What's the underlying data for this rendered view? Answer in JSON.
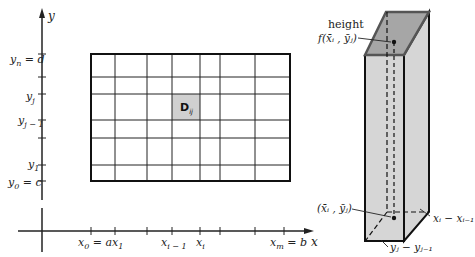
{
  "figure": {
    "axes": {
      "x_axis_label": "x",
      "y_axis_label": "y"
    },
    "x_ticks": [
      {
        "label": "x",
        "sub": "0",
        "suffix": " = a",
        "x": 91
      },
      {
        "label": "x",
        "sub": "1",
        "suffix": "",
        "x": 115
      },
      {
        "label": "x",
        "sub": "i − 1",
        "suffix": "",
        "x": 172
      },
      {
        "label": "x",
        "sub": "i",
        "suffix": "",
        "x": 200
      },
      {
        "label": "x",
        "sub": "m",
        "suffix": " = b",
        "x": 290
      }
    ],
    "y_ticks": [
      {
        "label": "y",
        "sub": "n",
        "suffix": " = d",
        "y": 54
      },
      {
        "label": "y",
        "sub": "j",
        "suffix": "",
        "y": 94
      },
      {
        "label": "y",
        "sub": "j − 1",
        "suffix": "",
        "y": 120
      },
      {
        "label": "y",
        "sub": "1",
        "suffix": "",
        "y": 165
      },
      {
        "label": "y",
        "sub": "0",
        "suffix": " = c",
        "y": 181
      }
    ],
    "grid": {
      "vertical_lines": [
        91,
        115,
        147,
        172,
        200,
        220,
        255,
        290
      ],
      "horizontal_lines": [
        54,
        77,
        94,
        120,
        138,
        165,
        181
      ]
    },
    "highlighted_cell": {
      "label": "D",
      "sub": "ij",
      "fill": "#d0d0d0"
    },
    "prism": {
      "height_label_line1": "height",
      "height_label_line2": "f(x̄ᵢ , ȳⱼ)",
      "point_label": "(x̄ᵢ , ȳⱼ)",
      "width_label": "xᵢ − xᵢ₋₁",
      "depth_label": "yⱼ − yⱼ₋₁",
      "top_fill": "#a6a6a6",
      "side_fill": "#d6d6d6"
    }
  }
}
